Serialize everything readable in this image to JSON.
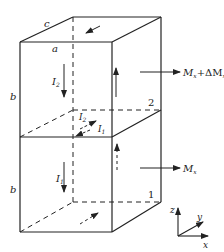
{
  "diagram": {
    "type": "physics-two-stacked-boxes-magnetization",
    "stroke_color": "#222222",
    "background": "#ffffff",
    "dimension_labels": {
      "a": "a",
      "b_top": "b",
      "b_bottom": "b",
      "c": "c"
    },
    "currents": {
      "I1_vertical": "I",
      "I1_vertical_sub": "1",
      "I2_vertical": "I",
      "I2_vertical_sub": "2",
      "I1_mid": "I",
      "I1_mid_sub": "1",
      "I2_mid": "I",
      "I2_mid_sub": "2"
    },
    "box_labels": {
      "upper": "2",
      "lower": "1"
    },
    "moments": {
      "upper_M": "M",
      "upper_M_sub": "x",
      "upper_plus": "+ΔM",
      "upper_plus_sub": "x",
      "lower_M": "M",
      "lower_M_sub": "x"
    },
    "axes": {
      "x": "x",
      "y": "y",
      "z": "z"
    }
  }
}
